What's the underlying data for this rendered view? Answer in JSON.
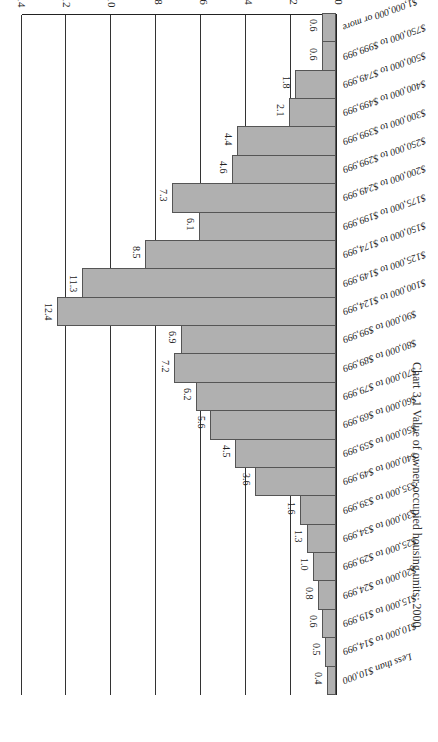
{
  "chart_data": {
    "type": "bar",
    "orientation": "horizontal",
    "title": "Chart 3.1 Value of owner-occupied housing units: 2000",
    "xlabel": "Percentage of housing units",
    "ylabel": "",
    "xlim": [
      0,
      14
    ],
    "ticks": [
      "0",
      "2",
      "4",
      "6",
      "8",
      "10",
      "12",
      "14"
    ],
    "grid": true,
    "legend": "none",
    "categories": [
      "Less than $10,000",
      "$10,000 to $14,999",
      "$15,000 to $19,999",
      "$20,000 to $24,999",
      "$25,000 to $29,999",
      "$30,000 to $34,999",
      "$35,000 to $39,999",
      "$40,000 to $49,999",
      "$50,000 to $59,999",
      "$60,000 to $69,999",
      "$70,000 to $79,999",
      "$80,000 to $89,999",
      "$90,000 to $99,999",
      "$100,000 to $124,999",
      "$125,000 to $149,999",
      "$150,000 to $174,999",
      "$175,000 to $199,999",
      "$200,000 to $249,999",
      "$250,000 to $299,999",
      "$300,000 to $399,999",
      "$400,000 to $499,999",
      "$500,000 to $749,999",
      "$750,000 to $999,999",
      "$1,000,000 or more"
    ],
    "values": [
      0.4,
      0.5,
      0.6,
      0.8,
      1.0,
      1.3,
      1.6,
      3.6,
      4.5,
      5.6,
      6.2,
      7.2,
      6.9,
      12.4,
      11.3,
      8.5,
      6.1,
      7.3,
      4.6,
      4.4,
      2.1,
      1.8,
      0.6,
      0.6
    ],
    "value_labels": [
      "0.4",
      "0.5",
      "0.6",
      "0.8",
      "1.0",
      "1.3",
      "1.6",
      "3.6",
      "4.5",
      "5.6",
      "6.2",
      "7.2",
      "6.9",
      "12.4",
      "11.3",
      "8.5",
      "6.1",
      "7.3",
      "4.6",
      "4.4",
      "2.1",
      "1.8",
      "0.6",
      "0.6"
    ],
    "bar_color": "#b0b0b0",
    "rotation": "image rotated 180 degrees"
  }
}
